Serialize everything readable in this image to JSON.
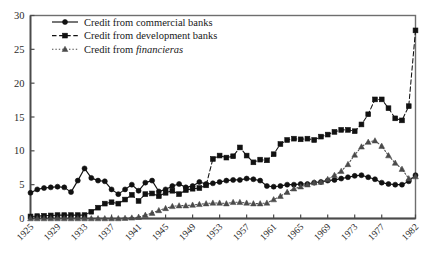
{
  "chart_data": {
    "type": "line",
    "title": "",
    "subtitle": "",
    "xlabel": "",
    "ylabel": "",
    "xlim": [
      1925,
      1982
    ],
    "ylim": [
      0,
      30
    ],
    "yticks": [
      0,
      5,
      10,
      15,
      20,
      25,
      30
    ],
    "xticks": [
      1925,
      1929,
      1933,
      1937,
      1941,
      1945,
      1949,
      1953,
      1957,
      1961,
      1965,
      1969,
      1973,
      1977,
      1982
    ],
    "grid": false,
    "legend_position": "top-left",
    "x": [
      1925,
      1926,
      1927,
      1928,
      1929,
      1930,
      1931,
      1932,
      1933,
      1934,
      1935,
      1936,
      1937,
      1938,
      1939,
      1940,
      1941,
      1942,
      1943,
      1944,
      1945,
      1946,
      1947,
      1948,
      1949,
      1950,
      1951,
      1952,
      1953,
      1954,
      1955,
      1956,
      1957,
      1958,
      1959,
      1960,
      1961,
      1962,
      1963,
      1964,
      1965,
      1966,
      1967,
      1968,
      1969,
      1970,
      1971,
      1972,
      1973,
      1974,
      1975,
      1976,
      1977,
      1978,
      1979,
      1980,
      1981,
      1982
    ],
    "series": [
      {
        "name": "Credit from commercial banks",
        "marker": "circle",
        "line_style": "solid",
        "color": "#111111",
        "values": [
          3.8,
          4.3,
          4.5,
          4.6,
          4.7,
          4.6,
          3.9,
          5.6,
          7.4,
          6.0,
          5.6,
          5.5,
          4.3,
          3.6,
          4.3,
          5.0,
          4.1,
          5.3,
          5.6,
          4.0,
          4.3,
          4.8,
          5.1,
          4.6,
          4.8,
          5.4,
          5.1,
          5.2,
          5.4,
          5.6,
          5.7,
          5.7,
          5.9,
          5.8,
          5.6,
          4.8,
          4.7,
          4.8,
          5.0,
          5.0,
          5.1,
          5.1,
          5.3,
          5.4,
          5.6,
          5.7,
          5.9,
          6.1,
          6.3,
          6.4,
          6.1,
          5.8,
          5.3,
          5.1,
          5.0,
          5.0,
          5.5,
          6.4
        ]
      },
      {
        "name": "Credit from development banks",
        "marker": "square",
        "line_style": "dashed",
        "color": "#111111",
        "values": [
          0.3,
          0.35,
          0.4,
          0.45,
          0.5,
          0.5,
          0.5,
          0.5,
          0.5,
          1.0,
          1.6,
          2.2,
          2.4,
          2.2,
          2.8,
          3.5,
          2.6,
          3.6,
          3.7,
          3.3,
          3.8,
          4.1,
          3.6,
          4.2,
          4.4,
          4.5,
          4.9,
          8.8,
          9.3,
          9.0,
          9.2,
          10.5,
          9.3,
          8.3,
          8.7,
          8.6,
          9.5,
          11.0,
          11.6,
          11.8,
          11.7,
          11.8,
          11.6,
          12.1,
          12.4,
          12.8,
          13.1,
          13.1,
          12.9,
          13.9,
          15.4,
          17.6,
          17.6,
          16.3,
          14.8,
          14.5,
          16.6,
          27.8
        ]
      },
      {
        "name": "Credit from financieras",
        "marker": "triangle",
        "line_style": "dotted",
        "color": "#4a4a4a",
        "values": [
          0.0,
          0.0,
          0.0,
          0.0,
          0.0,
          0.0,
          0.0,
          0.0,
          0.0,
          0.0,
          0.0,
          0.0,
          0.0,
          0.0,
          0.05,
          0.1,
          0.2,
          0.5,
          0.8,
          1.2,
          1.5,
          1.8,
          1.9,
          1.9,
          2.0,
          2.1,
          2.2,
          2.3,
          2.3,
          2.2,
          2.4,
          2.4,
          2.3,
          2.2,
          2.2,
          2.3,
          2.8,
          3.3,
          3.9,
          4.4,
          4.7,
          5.0,
          5.3,
          5.4,
          5.8,
          6.4,
          7.0,
          8.0,
          9.4,
          10.6,
          11.3,
          11.5,
          10.7,
          9.3,
          8.2,
          7.3,
          5.9,
          6.2
        ]
      }
    ]
  },
  "legend": {
    "items": [
      {
        "label": "Credit from commercial banks",
        "marker": "circle",
        "style": "solid"
      },
      {
        "label": "Credit from development banks",
        "marker": "square",
        "style": "dashed"
      },
      {
        "label_prefix": "Credit from ",
        "label_italic": "financieras",
        "marker": "triangle",
        "style": "dotted"
      }
    ]
  }
}
